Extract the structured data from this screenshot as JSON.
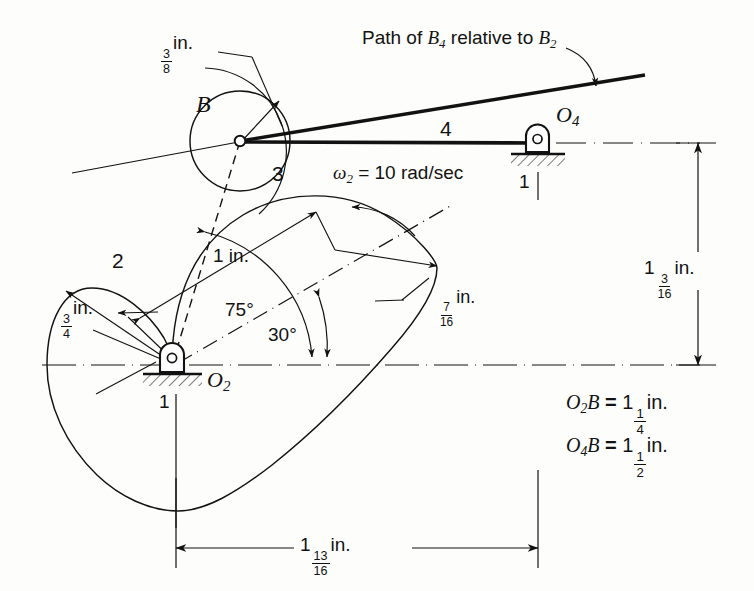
{
  "figure": {
    "type": "mechanism-kinematic-diagram",
    "background_color": "#fdfdfc",
    "line_color": "#121212"
  },
  "labels": {
    "roller_letter": "B",
    "link_2": "2",
    "link_3": "3",
    "link_4": "4",
    "ground_left": "1",
    "ground_right": "1",
    "pivot_o2": {
      "base": "O",
      "sub": "2"
    },
    "pivot_o4": {
      "base": "O",
      "sub": "4"
    },
    "angle_75": "75°",
    "angle_30": "30°"
  },
  "annotations": {
    "path_note": {
      "prefix": "Path of ",
      "b4": {
        "base": "B",
        "sub": "4"
      },
      "middle": " relative to ",
      "b2": {
        "base": "B",
        "sub": "2"
      }
    },
    "omega": {
      "symbol": "ω",
      "sub": "2",
      "equals": " = 10 rad/sec",
      "value": 10,
      "units": "rad/sec"
    }
  },
  "dimensions": {
    "roller_radius": {
      "whole": "",
      "num": "3",
      "den": "8",
      "unit": "in.",
      "value_in": 0.375
    },
    "cam_min_radius": {
      "whole": "",
      "num": "3",
      "den": "4",
      "unit": "in.",
      "value_in": 0.75
    },
    "one_inch": {
      "text": "1 in.",
      "value_in": 1.0
    },
    "seven_sixteenths": {
      "whole": "",
      "num": "7",
      "den": "16",
      "unit": "in.",
      "value_in": 0.4375
    },
    "vertical_offset": {
      "whole": "1",
      "num": "3",
      "den": "16",
      "unit": "in.",
      "value_in": 1.1875
    },
    "horizontal_span": {
      "whole": "1",
      "num": "13",
      "den": "16",
      "unit": "in.",
      "value_in": 1.8125
    }
  },
  "equations": [
    {
      "lhs_base_1": "O",
      "lhs_sub_1": "2",
      "lhs_base_2": "B",
      "eq": " = ",
      "whole": "1",
      "num": "1",
      "den": "4",
      "unit": "in.",
      "value_in": 1.25
    },
    {
      "lhs_base_1": "O",
      "lhs_sub_1": "4",
      "lhs_base_2": "B",
      "eq": " = ",
      "whole": "1",
      "num": "1",
      "den": "2",
      "unit": "in.",
      "value_in": 1.5
    }
  ]
}
